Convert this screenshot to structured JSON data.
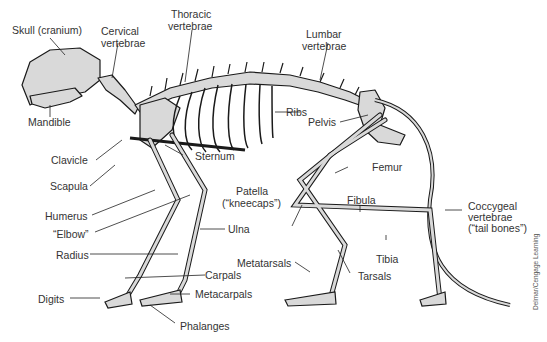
{
  "diagram": {
    "colors": {
      "bone_fill": "#d9d9d9",
      "bone_stroke": "#1a1a1a",
      "leader": "#222222",
      "text": "#333333",
      "background": "#ffffff"
    },
    "labels": {
      "skull": "Skull (cranium)",
      "cervical_1": "Cervical",
      "cervical_2": "vertebrae",
      "thoracic_1": "Thoracic",
      "thoracic_2": "vertebrae",
      "lumbar_1": "Lumbar",
      "lumbar_2": "vertebrae",
      "mandible": "Mandible",
      "ribs": "Ribs",
      "pelvis": "Pelvis",
      "clavicle": "Clavicle",
      "sternum": "Sternum",
      "scapula": "Scapula",
      "femur": "Femur",
      "patella_1": "Patella",
      "patella_2": "(“kneecaps”)",
      "humerus": "Humerus",
      "elbow": "“Elbow”",
      "ulna": "Ulna",
      "fibula": "Fibula",
      "coccygeal_1": "Coccygeal",
      "coccygeal_2": "vertebrae",
      "coccygeal_3": "(“tail bones”)",
      "radius": "Radius",
      "tibia": "Tibia",
      "metatarsals": "Metatarsals",
      "carpals": "Carpals",
      "tarsals": "Tarsals",
      "digits": "Digits",
      "metacarpals": "Metacarpals",
      "phalanges": "Phalanges"
    },
    "credit": "Delmar/Cengage Learning"
  }
}
